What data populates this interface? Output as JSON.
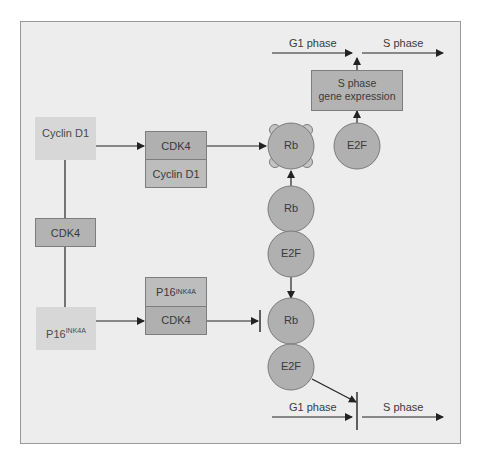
{
  "diagram": {
    "nodes": {
      "cyclin_d1_free": {
        "label": "Cyclin D1"
      },
      "cdk4_free": {
        "label": "CDK4"
      },
      "p16_free": {
        "label": "P16",
        "sup": "INK4A"
      },
      "complex_cdk4_cyclin": {
        "top": "CDK4",
        "bottom": "Cyclin D1"
      },
      "complex_p16_cdk4": {
        "top": "P16",
        "top_sup": "INK4A",
        "bottom": "CDK4"
      },
      "rb_phosphorylated": {
        "label": "Rb"
      },
      "e2f_free": {
        "label": "E2F"
      },
      "rb_mid": {
        "label": "Rb"
      },
      "e2f_mid": {
        "label": "E2F"
      },
      "rb_bottom": {
        "label": "Rb"
      },
      "e2f_bottom": {
        "label": "E2F"
      },
      "gene_expression": {
        "line1": "S phase",
        "line2": "gene expression"
      }
    },
    "phases": {
      "top": {
        "g1": "G1 phase",
        "s": "S phase"
      },
      "bottom": {
        "g1": "G1 phase",
        "s": "S phase"
      }
    },
    "colors": {
      "background": "#ededed",
      "light_box": "#d7d7d7",
      "dark_box": "#b3b3b3",
      "circle": "#b0b0b0",
      "line": "#222222"
    }
  }
}
